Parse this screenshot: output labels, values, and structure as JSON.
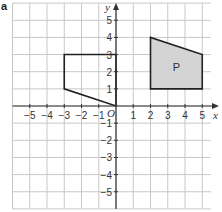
{
  "label": "a",
  "axes": {
    "x_label": "x",
    "y_label": "y",
    "origin_label": "O",
    "x_range": [
      -6,
      5
    ],
    "y_range": [
      -6,
      6
    ],
    "x_ticks": [
      "-5",
      "-4",
      "-3",
      "-2",
      "-1",
      "1",
      "2",
      "3",
      "4",
      "5"
    ],
    "y_ticks": [
      "5",
      "4",
      "3",
      "2",
      "1",
      "-1",
      "-2",
      "-3",
      "-4",
      "-5"
    ]
  },
  "shapes": [
    {
      "name": "P",
      "label": "P",
      "vertices": [
        [
          2,
          1
        ],
        [
          2,
          4
        ],
        [
          5,
          3
        ],
        [
          5,
          1
        ]
      ],
      "fill": "#d4d4d4",
      "stroke": "#222222"
    },
    {
      "name": "unlabelled-shape",
      "label": "",
      "vertices": [
        [
          -3,
          3
        ],
        [
          0,
          3
        ],
        [
          0,
          0
        ],
        [
          -3,
          1
        ]
      ],
      "fill": "none",
      "stroke": "#222222"
    }
  ],
  "colors": {
    "grid": "#c8c8c8",
    "axis": "#333333",
    "shape_fill": "#d4d4d4"
  }
}
